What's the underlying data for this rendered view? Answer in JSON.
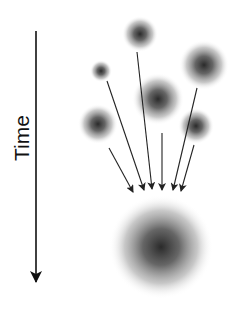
{
  "diagram": {
    "axis_label": "Time",
    "axis": {
      "x": 36,
      "y1": 31,
      "y2": 282,
      "direction": "down"
    },
    "small_blobs": [
      {
        "cx": 140,
        "cy": 34,
        "r": 18
      },
      {
        "cx": 101,
        "cy": 71,
        "r": 11
      },
      {
        "cx": 204,
        "cy": 65,
        "r": 25
      },
      {
        "cx": 158,
        "cy": 99,
        "r": 26
      },
      {
        "cx": 98,
        "cy": 124,
        "r": 20
      },
      {
        "cx": 196,
        "cy": 126,
        "r": 18
      }
    ],
    "merged_blob": {
      "cx": 161,
      "cy": 247,
      "r": 52
    },
    "arrows": [
      {
        "x1": 109,
        "y1": 148,
        "x2": 133,
        "y2": 192
      },
      {
        "x1": 107,
        "y1": 81,
        "x2": 144,
        "y2": 190
      },
      {
        "x1": 137,
        "y1": 52,
        "x2": 152,
        "y2": 189
      },
      {
        "x1": 162,
        "y1": 133,
        "x2": 162,
        "y2": 190
      },
      {
        "x1": 197,
        "y1": 88,
        "x2": 173,
        "y2": 190
      },
      {
        "x1": 194,
        "y1": 145,
        "x2": 181,
        "y2": 191
      }
    ],
    "colors": {
      "blob_core": "#2a2a2a",
      "line": "#222222",
      "background": "#ffffff"
    }
  }
}
